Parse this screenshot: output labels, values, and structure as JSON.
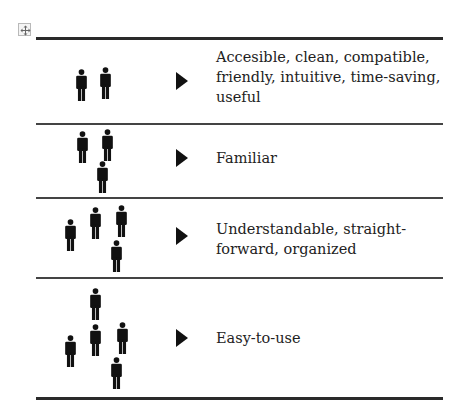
{
  "table_move_handle": {
    "icon": "move-arrows-icon"
  },
  "rows": [
    {
      "people_count": 2,
      "label": "Accesible, clean, compatible, friendly, intuitive, time-saving, useful"
    },
    {
      "people_count": 3,
      "label": "Familiar"
    },
    {
      "people_count": 4,
      "label": "Understandable, straight-forward, organized"
    },
    {
      "people_count": 5,
      "label": "Easy-to-use"
    }
  ],
  "colors": {
    "rule": "#2a2a2a",
    "icon": "#111111",
    "text": "#222222"
  }
}
